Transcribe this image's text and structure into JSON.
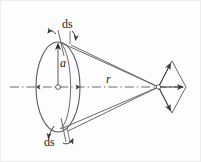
{
  "figure": {
    "background_color": "#fdfdfd",
    "stroke_color": "#4a4a4a",
    "ink_color": "#1a1a1a",
    "labels": {
      "ds_top": "ds",
      "ds_bottom": "ds",
      "radius": "a",
      "distance": "r"
    },
    "elements": {
      "loop_name": "current loop ellipse",
      "axis_name": "dash-dot symmetry axis",
      "cone_name": "cone of field lines to apex",
      "apex_name": "field point with vector diamond"
    }
  }
}
